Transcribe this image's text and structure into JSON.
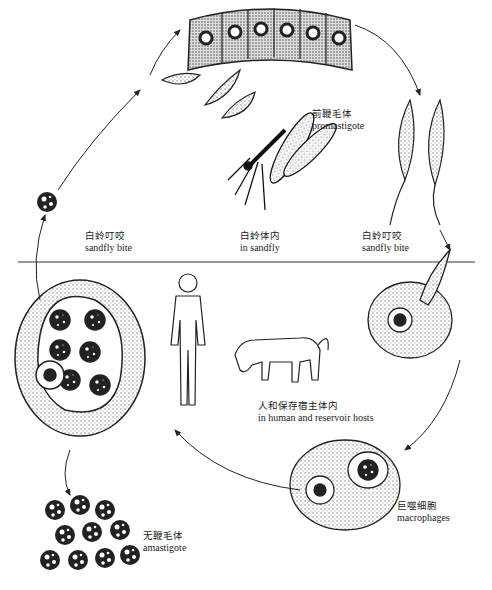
{
  "diagram": {
    "divider_label": "",
    "labels": [
      {
        "id": "sandfly-bite-left",
        "zh": "白蛉叮咬",
        "en": "sandfly bite"
      },
      {
        "id": "in-sandfly",
        "zh": "白蛉体内",
        "en": "in sandfly"
      },
      {
        "id": "sandfly-bite-right",
        "zh": "白蛉叮咬",
        "en": "sandfly bite"
      },
      {
        "id": "promastigote",
        "zh": "前鞭毛体",
        "en": "promastigote"
      },
      {
        "id": "human-reservoir",
        "zh": "人和保存宿主体内",
        "en": "in human and reservoir hosts"
      },
      {
        "id": "macrophages",
        "zh": "巨噬细胞",
        "en": "macrophages"
      },
      {
        "id": "amastigote",
        "zh": "无鞭毛体",
        "en": "amastigote"
      }
    ],
    "stages": [
      "sandfly-gut-epithelium",
      "promastigote",
      "macrophage-invasion",
      "macrophage-with-amastigotes",
      "ruptured-macrophage",
      "free-amastigotes",
      "human-host",
      "dog-reservoir-host",
      "sandfly"
    ],
    "colors": {
      "ink": "#1a1a1a",
      "stipple": "#bdbdbd",
      "background": "#ffffff"
    }
  }
}
